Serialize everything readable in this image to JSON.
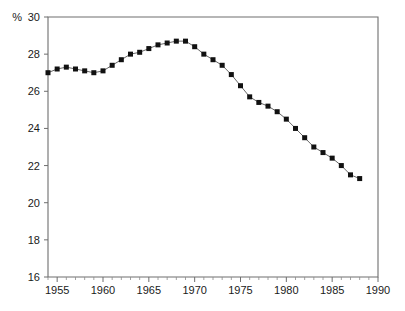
{
  "chart_data": {
    "type": "line",
    "title": "",
    "subtitle": "",
    "xlabel": "",
    "ylabel": "",
    "unit_label": "%",
    "xlim": [
      1954,
      1990
    ],
    "ylim": [
      16,
      30
    ],
    "grid": false,
    "legend": null,
    "y_ticks": [
      16,
      18,
      20,
      22,
      24,
      26,
      28,
      30
    ],
    "y_tick_labels": [
      "16",
      "18",
      "20",
      "22",
      "24",
      "26",
      "28",
      "30"
    ],
    "x_ticks": [
      1955,
      1960,
      1965,
      1970,
      1975,
      1980,
      1985,
      1990
    ],
    "x_tick_labels": [
      "1955",
      "1960",
      "1965",
      "1970",
      "1975",
      "1980",
      "1985",
      "1990"
    ],
    "x_minor_step": 1,
    "marker": "square",
    "marker_color": "#111111",
    "line_color": "#555555",
    "axis_color": "#6e6e6e",
    "x": [
      1954,
      1955,
      1956,
      1957,
      1958,
      1959,
      1960,
      1961,
      1962,
      1963,
      1964,
      1965,
      1966,
      1967,
      1968,
      1969,
      1970,
      1971,
      1972,
      1973,
      1974,
      1975,
      1976,
      1977,
      1978,
      1979,
      1980,
      1981,
      1982,
      1983,
      1984,
      1985,
      1986,
      1987,
      1988
    ],
    "values": [
      27.0,
      27.2,
      27.3,
      27.2,
      27.1,
      27.0,
      27.1,
      27.4,
      27.7,
      28.0,
      28.1,
      28.3,
      28.5,
      28.6,
      28.7,
      28.7,
      28.4,
      28.0,
      27.7,
      27.4,
      26.9,
      26.3,
      25.7,
      25.4,
      25.2,
      24.9,
      24.5,
      24.0,
      23.5,
      23.0,
      22.7,
      22.4,
      22.0,
      21.5,
      21.3
    ],
    "series": [
      {
        "name": "series-1",
        "values": [
          27.0,
          27.2,
          27.3,
          27.2,
          27.1,
          27.0,
          27.1,
          27.4,
          27.7,
          28.0,
          28.1,
          28.3,
          28.5,
          28.6,
          28.7,
          28.7,
          28.4,
          28.0,
          27.7,
          27.4,
          26.9,
          26.3,
          25.7,
          25.4,
          25.2,
          24.9,
          24.5,
          24.0,
          23.5,
          23.0,
          22.7,
          22.4,
          22.0,
          21.5,
          21.3
        ]
      }
    ]
  }
}
